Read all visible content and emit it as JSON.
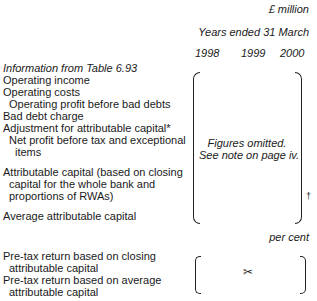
{
  "header": {
    "unit": "£ million",
    "period": "Years ended 31 March",
    "years": [
      "1998",
      "1999",
      "2000"
    ]
  },
  "rows": {
    "source": "Information from Table 6.93",
    "operating_income": "Operating income",
    "operating_costs": "Operating costs",
    "operating_profit": "Operating profit before bad debts",
    "bad_debt": "Bad debt charge",
    "adjustment": "Adjustment for attributable capital*",
    "net_profit_1": "Net profit before tax and exceptional",
    "net_profit_2": "items",
    "attr_capital_1": "Attributable capital (based on closing",
    "attr_capital_2": "capital for the whole bank and",
    "attr_capital_3": "proportions of RWAs)",
    "avg_capital": "Average attributable capital"
  },
  "omitted": {
    "line1": "Figures omitted.",
    "line2": "See note on page iv.",
    "dagger": "†"
  },
  "percent": {
    "unit": "per cent",
    "closing_1": "Pre-tax return based on closing",
    "closing_2": "attributable capital",
    "average_1": "Pre-tax return based on average",
    "average_2": "attributable capital",
    "scissors": "✂"
  }
}
